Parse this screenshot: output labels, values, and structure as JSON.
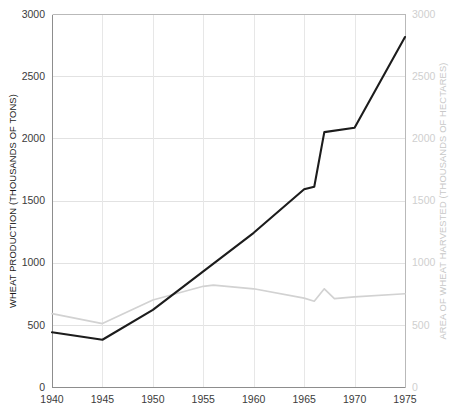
{
  "chart_data": {
    "type": "line",
    "title": "",
    "xlabel": "",
    "ylabel": "WHEAT PRODUCTION (THOUSANDS OF TONS)",
    "y2label": "AREA OF WHEAT HARVESTED (THOUSANDS OF HECTARES)",
    "xlim": [
      1940,
      1975
    ],
    "ylim": [
      0,
      3000
    ],
    "y2lim": [
      0,
      3000
    ],
    "xticks": [
      1940,
      1945,
      1950,
      1955,
      1960,
      1965,
      1970,
      1975
    ],
    "xtick_labels": [
      "1940",
      "1945",
      "1950",
      "1955",
      "1960",
      "1965",
      "1970",
      "1975"
    ],
    "yticks": [
      0,
      500,
      1000,
      1500,
      2000,
      2500,
      3000
    ],
    "ytick_labels": [
      "0",
      "500",
      "1000",
      "1500",
      "2000",
      "2500",
      "3000"
    ],
    "y2ticks": [
      0,
      500,
      1000,
      1500,
      2000,
      2500,
      3000
    ],
    "y2tick_labels": [
      "0",
      "500",
      "1000",
      "1500",
      "2000",
      "2500",
      "3000"
    ],
    "grid": true,
    "grid_axis": "both",
    "legend": "none",
    "colors": {
      "production_line": "#1c1c1c",
      "area_line": "#d2d2d2",
      "gridline": "#e2e2e2",
      "axis": "#8d8d8d",
      "right_axis_text": "#cfcfcf",
      "left_axis_text": "#3b3b3b",
      "background": "#ffffff"
    },
    "series": [
      {
        "name": "WHEAT PRODUCTION (THOUSANDS OF TONS)",
        "axis": "left",
        "color": "#1c1c1c",
        "x": [
          1940,
          1945,
          1950,
          1955,
          1960,
          1965,
          1966,
          1967,
          1970,
          1975
        ],
        "values": [
          440,
          380,
          620,
          930,
          1240,
          1590,
          1610,
          2050,
          2085,
          2815
        ]
      },
      {
        "name": "AREA OF WHEAT HARVESTED (THOUSANDS OF HECTARES)",
        "axis": "right",
        "color": "#d2d2d2",
        "x": [
          1940,
          1945,
          1950,
          1955,
          1956,
          1960,
          1965,
          1966,
          1967,
          1968,
          1970,
          1975
        ],
        "values": [
          590,
          510,
          700,
          810,
          820,
          790,
          715,
          690,
          790,
          710,
          725,
          750
        ]
      }
    ]
  },
  "plot_geometry": {
    "left": 52,
    "right": 405,
    "top": 14,
    "bottom": 387
  }
}
